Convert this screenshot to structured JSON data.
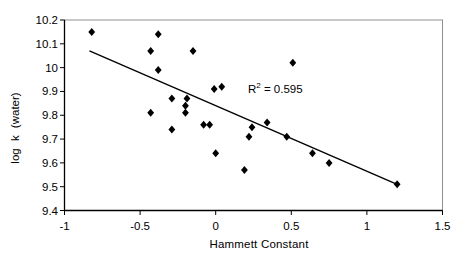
{
  "chart_data": {
    "type": "scatter",
    "title": "",
    "xlabel": "Hammett Constant",
    "ylabel": "log k (water)",
    "xlim": [
      -1,
      1.5
    ],
    "ylim": [
      9.4,
      10.2
    ],
    "grid": false,
    "legend": null,
    "x_tick_values": [
      -1,
      -0.5,
      0,
      0.5,
      1,
      1.5
    ],
    "x_tick_labels": [
      "-1",
      "-0.5",
      "0",
      "0.5",
      "1",
      "1.5"
    ],
    "y_tick_values": [
      10.2,
      10.1,
      10.0,
      9.9,
      9.8,
      9.7,
      9.6,
      9.5,
      9.4
    ],
    "y_tick_labels": [
      "10.2",
      "10.1",
      "10",
      "9.9",
      "9.8",
      "9.7",
      "9.6",
      "9.5",
      "9.4"
    ],
    "points": [
      [
        -0.82,
        10.15
      ],
      [
        -0.38,
        10.14
      ],
      [
        -0.43,
        10.07
      ],
      [
        -0.15,
        10.07
      ],
      [
        -0.38,
        9.99
      ],
      [
        0.51,
        10.02
      ],
      [
        -0.29,
        9.87
      ],
      [
        -0.19,
        9.87
      ],
      [
        -0.2,
        9.84
      ],
      [
        -0.2,
        9.81
      ],
      [
        -0.43,
        9.81
      ],
      [
        -0.01,
        9.91
      ],
      [
        0.04,
        9.92
      ],
      [
        -0.29,
        9.74
      ],
      [
        -0.08,
        9.76
      ],
      [
        -0.04,
        9.76
      ],
      [
        0.24,
        9.75
      ],
      [
        0.22,
        9.71
      ],
      [
        0.34,
        9.77
      ],
      [
        0.47,
        9.71
      ],
      [
        0.0,
        9.64
      ],
      [
        0.19,
        9.57
      ],
      [
        0.64,
        9.64
      ],
      [
        0.75,
        9.6
      ],
      [
        1.2,
        9.51
      ]
    ],
    "trendline": {
      "x1": -0.835,
      "y1": 10.07,
      "x2": 1.2,
      "y2": 9.51
    },
    "r_squared": 0.595,
    "annotation": {
      "prefix": "R",
      "superscript": "2",
      "suffix": " = 0.595"
    },
    "marker": {
      "shape": "diamond",
      "color": "#000000"
    },
    "colors": {
      "background": "#ffffff",
      "axis": "#000000",
      "frame": "#909090",
      "text": "#000000",
      "trendline": "#000000"
    }
  }
}
